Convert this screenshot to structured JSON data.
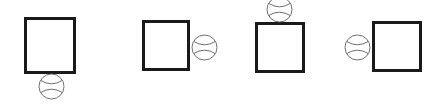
{
  "scene": {
    "title": "Square and ball spatial relation panels",
    "width": 439,
    "height": 105,
    "background_color": "#ffffff",
    "square_stroke_color": "#1a1a1a",
    "square_fill_color": "#ffffff",
    "ball_stroke_color": "#6e6e6e",
    "ball_fill_color": "#ffffff",
    "square_stroke_width": 3,
    "ball_stroke_width": 1,
    "panel_count": 4
  },
  "panels": [
    {
      "id": "panel-1",
      "relation": "ball-below-square",
      "square": {
        "x": 24,
        "y": 17,
        "width": 52,
        "height": 57
      },
      "ball": {
        "cx": 51,
        "cy": 86,
        "r": 12.5,
        "clipped": "none"
      }
    },
    {
      "id": "panel-2",
      "relation": "ball-right-of-square",
      "square": {
        "x": 142,
        "y": 20,
        "width": 48,
        "height": 51
      },
      "ball": {
        "cx": 204,
        "cy": 47,
        "r": 12.5,
        "clipped": "none"
      }
    },
    {
      "id": "panel-3",
      "relation": "ball-above-square",
      "square": {
        "x": 255,
        "y": 22,
        "width": 50,
        "height": 51
      },
      "ball": {
        "cx": 279,
        "cy": 9,
        "r": 12.5,
        "clipped": "top"
      }
    },
    {
      "id": "panel-4",
      "relation": "ball-left-of-square",
      "square": {
        "x": 372,
        "y": 21,
        "width": 50,
        "height": 51
      },
      "ball": {
        "cx": 357,
        "cy": 47,
        "r": 12.5,
        "clipped": "none"
      }
    }
  ]
}
